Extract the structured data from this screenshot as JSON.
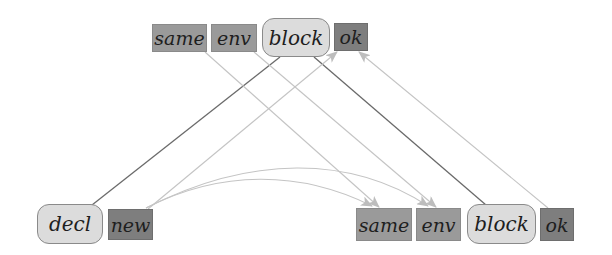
{
  "diagram": {
    "top_row": {
      "nodes": [
        {
          "id": "top-same",
          "label": "same",
          "style": "box"
        },
        {
          "id": "top-env",
          "label": "env",
          "style": "box"
        },
        {
          "id": "top-block",
          "label": "block",
          "style": "rounded"
        },
        {
          "id": "top-ok",
          "label": "ok",
          "style": "box-dark"
        }
      ]
    },
    "bottom_row": {
      "nodes": [
        {
          "id": "decl",
          "label": "decl",
          "style": "rounded"
        },
        {
          "id": "new",
          "label": "new",
          "style": "box-dark"
        },
        {
          "id": "bottom-same",
          "label": "same",
          "style": "box"
        },
        {
          "id": "bottom-env",
          "label": "env",
          "style": "box"
        },
        {
          "id": "bottom-block",
          "label": "block",
          "style": "rounded"
        },
        {
          "id": "bottom-ok",
          "label": "ok",
          "style": "box-dark"
        }
      ]
    },
    "edges": [
      {
        "from": "top-block",
        "to": "decl",
        "type": "tree-line"
      },
      {
        "from": "top-block",
        "to": "bottom-block",
        "type": "tree-line"
      },
      {
        "from": "top-same",
        "to": "bottom-same",
        "type": "arrow"
      },
      {
        "from": "top-env",
        "to": "bottom-env",
        "type": "arrow"
      },
      {
        "from": "new",
        "to": "top-ok",
        "type": "arrow"
      },
      {
        "from": "bottom-ok",
        "to": "top-ok",
        "type": "arrow"
      },
      {
        "from": "new",
        "to": "bottom-same",
        "type": "curved-arrow"
      },
      {
        "from": "new",
        "to": "bottom-env",
        "type": "curved-arrow"
      }
    ],
    "colors": {
      "background": "#ffffff",
      "box": "#9a9a9a",
      "box_dark": "#7e7e7e",
      "rounded_fill": "#dcdcdc",
      "tree_line": "#6a6a6a",
      "arrow": "#c4c4c4"
    }
  }
}
